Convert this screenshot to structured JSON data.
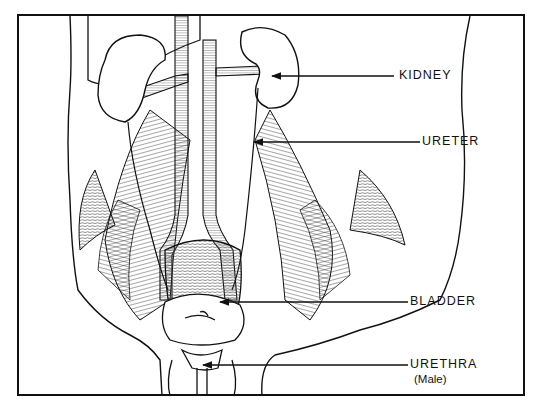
{
  "figure": {
    "labels": [
      {
        "id": "kidney",
        "text": "KIDNEY"
      },
      {
        "id": "ureter",
        "text": "URETER"
      },
      {
        "id": "bladder",
        "text": "BLADDER"
      },
      {
        "id": "urethra",
        "text": "URETHRA",
        "note": "(Male)"
      }
    ]
  },
  "colors": {
    "ink": "#111111",
    "paper": "#ffffff"
  }
}
